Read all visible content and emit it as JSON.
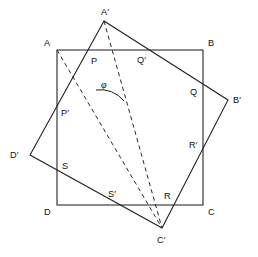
{
  "figure": {
    "width": 258,
    "height": 257,
    "background_color": "#ffffff",
    "line_color": "#1b1b1b",
    "dashed_color": "#2a2a2a"
  },
  "squares": {
    "outer": {
      "name": "ABCD",
      "style": "solid",
      "points": "57,50 203,50 203,205 57,205",
      "vertices": [
        {
          "id": "A",
          "label": "A",
          "x": 57,
          "y": 50,
          "label_x": 44,
          "label_y": 46
        },
        {
          "id": "B",
          "label": "B",
          "x": 203,
          "y": 50,
          "label_x": 208,
          "label_y": 46
        },
        {
          "id": "C",
          "label": "C",
          "x": 203,
          "y": 205,
          "label_x": 208,
          "label_y": 215
        },
        {
          "id": "D",
          "label": "D",
          "x": 57,
          "y": 205,
          "label_x": 44,
          "label_y": 215
        }
      ]
    },
    "rotated": {
      "name": "A'B'C'D'",
      "style": "solid",
      "points": "104,21 228,100 162,228 30,155",
      "vertices": [
        {
          "id": "Ap",
          "label": "A′",
          "x": 104,
          "y": 21,
          "label_x": 101,
          "label_y": 15
        },
        {
          "id": "Bp",
          "label": "B′",
          "x": 228,
          "y": 100,
          "label_x": 233,
          "label_y": 100
        },
        {
          "id": "Cp",
          "label": "C′",
          "x": 162,
          "y": 228,
          "label_x": 157,
          "label_y": 243
        },
        {
          "id": "Dp",
          "label": "D′",
          "x": 30,
          "y": 155,
          "label_x": 10,
          "label_y": 155
        }
      ]
    }
  },
  "intersections": [
    {
      "id": "P",
      "label": "P",
      "x": 88,
      "y": 50,
      "label_x": 91,
      "label_y": 64,
      "on": "AB and A'D'"
    },
    {
      "id": "Qp",
      "label": "Q′",
      "x": 146,
      "y": 50,
      "label_x": 137,
      "label_y": 63,
      "on": "AB and A'B'"
    },
    {
      "id": "Q",
      "label": "Q",
      "x": 203,
      "y": 87,
      "label_x": 190,
      "label_y": 95,
      "on": "BC and A'B'"
    },
    {
      "id": "Rp",
      "label": "R′",
      "x": 203,
      "y": 142,
      "label_x": 189,
      "label_y": 148,
      "on": "BC and B'C'"
    },
    {
      "id": "R",
      "label": "R",
      "x": 173,
      "y": 205,
      "label_x": 164,
      "label_y": 199,
      "on": "DC and B'C'"
    },
    {
      "id": "Sp",
      "label": "S′",
      "x": 117,
      "y": 205,
      "label_x": 108,
      "label_y": 197,
      "on": "DC and C'D'"
    },
    {
      "id": "S",
      "label": "S",
      "x": 57,
      "y": 172,
      "label_x": 62,
      "label_y": 169,
      "on": "AD and C'D'"
    },
    {
      "id": "Pp",
      "label": "P′",
      "x": 57,
      "y": 122,
      "label_x": 61,
      "label_y": 116,
      "on": "AD and A'D'"
    }
  ],
  "dashed_lines": [
    {
      "id": "diag-A-Cp",
      "name": "diagonal-A-to-C-prime",
      "from": "A",
      "to": "C′",
      "path": "M 57,50 L 162,228"
    },
    {
      "id": "diag-Ap-Cp",
      "name": "diagonal-A-prime-to-C-prime",
      "from": "A′",
      "to": "C′",
      "path": "M 104,21 L 162,228"
    }
  ],
  "angle": {
    "symbol": "φ",
    "name": "rotation-angle-phi",
    "label_x": 101,
    "label_y": 88,
    "arc_path": "M 96,90 A 30,30 0 0 1 124,101",
    "description": "angle between the dashed lines A-C' and A'-C'"
  }
}
